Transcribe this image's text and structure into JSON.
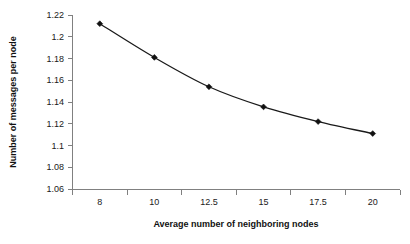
{
  "chart_data": {
    "type": "line",
    "title": "",
    "subtitle": "",
    "xlabel": "Average number of neighboring nodes",
    "ylabel": "Number of messages per node",
    "categories": [
      "8",
      "10",
      "12.5",
      "15",
      "17.5",
      "20"
    ],
    "x": [
      8,
      10,
      12.5,
      15,
      17.5,
      20
    ],
    "values": [
      1.212,
      1.181,
      1.154,
      1.1355,
      1.122,
      1.111
    ],
    "series": [
      {
        "name": "Number of messages per node",
        "values": [
          1.212,
          1.181,
          1.154,
          1.1355,
          1.122,
          1.111
        ]
      }
    ],
    "ylim": [
      1.06,
      1.22
    ],
    "ytick_labels": [
      "1.22",
      "1.2",
      "1.18",
      "1.16",
      "1.14",
      "1.12",
      "1.1",
      "1.08",
      "1.06"
    ],
    "ytick_values": [
      1.22,
      1.2,
      1.18,
      1.16,
      1.14,
      1.12,
      1.1,
      1.08,
      1.06
    ],
    "xtick_labels": [
      "8",
      "10",
      "12.5",
      "15",
      "17.5",
      "20"
    ],
    "grid": false,
    "legend": false,
    "legend_position": "none",
    "axis_type": "category",
    "marker": "diamond",
    "line_color": "#1a1a1a",
    "marker_color": "#111111",
    "axis_color": "#808080",
    "background_color": "#ffffff",
    "annotations": []
  },
  "figure": {
    "caption": ""
  }
}
